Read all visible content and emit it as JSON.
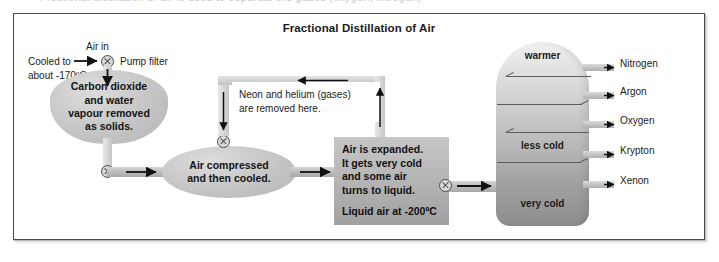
{
  "caption_sliver": "Fractional distillation of air is used to separate the gases (oxygen, nitrogen)",
  "figure": {
    "title": "Fractional Distillation of Air"
  },
  "inlet": {
    "air_in_label": "Air in",
    "cooled_label_line1": "Cooled to",
    "cooled_label_line2": "about -170ºC",
    "pump_filter_label": "Pump filter"
  },
  "stages": {
    "co2_removal": {
      "line1": "Carbon dioxide",
      "line2": "and water",
      "line3": "vapour removed",
      "line4": "as solids."
    },
    "compressor": {
      "line1": "Air compressed",
      "line2": "and then cooled."
    },
    "expander": {
      "line1": "Air is expanded.",
      "line2": "It gets very cold",
      "line3": "and some air",
      "line4": "turns to liquid.",
      "liquid_air": "Liquid air at -200ºC"
    },
    "neon_callout": {
      "line1": "Neon and helium (gases)",
      "line2": "are removed here."
    }
  },
  "column": {
    "label_top": "warmer",
    "label_middle": "less cold",
    "label_bottom": "very cold",
    "outputs": [
      {
        "name": "Nitrogen"
      },
      {
        "name": "Argon"
      },
      {
        "name": "Oxygen"
      },
      {
        "name": "Krypton"
      },
      {
        "name": "Xenon"
      }
    ]
  },
  "icons": {
    "valve": "valve-cross-icon",
    "arrow_right": "arrow-right-icon",
    "arrow_down": "arrow-down-icon",
    "arrow_up": "arrow-up-icon",
    "arrow_left": "arrow-left-icon"
  },
  "colors": {
    "frame_border": "#4a4a4a",
    "pipe_mid": "#bdbdbd",
    "blob_fill": "#c9c9c9",
    "column_top": "#f1f1f1",
    "column_bottom": "#8d8d8d",
    "text": "#1b1b1b",
    "arrow": "#111111"
  }
}
